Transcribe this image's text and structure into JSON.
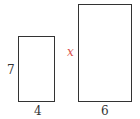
{
  "shapes": {
    "small_rect": {
      "height_label": "7",
      "width_label": "4"
    },
    "large_rect": {
      "height_label": "x",
      "width_label": "6"
    }
  },
  "colors": {
    "unknown_label": "#d9534f",
    "stroke": "#333333"
  }
}
